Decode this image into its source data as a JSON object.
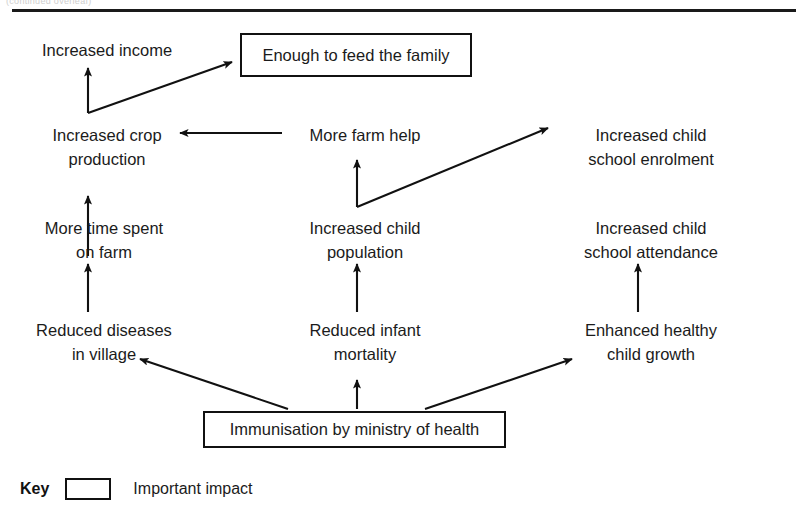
{
  "page": {
    "top_caption": "(continued overleaf)",
    "background": "#ffffff",
    "ink": "#1b1b1b"
  },
  "diagram": {
    "type": "flow-diagram",
    "nodes": [
      {
        "id": "increased-income",
        "label": "Increased income",
        "style": "plain",
        "x": 22,
        "y": 38,
        "w": 170
      },
      {
        "id": "enough-to-feed-family",
        "label": "Enough to feed the family",
        "style": "boxed",
        "x": 240,
        "y": 33,
        "w": 232,
        "h": 44
      },
      {
        "id": "increased-crop-production",
        "label": "Increased crop\nproduction",
        "style": "plain",
        "x": 22,
        "y": 123,
        "w": 170
      },
      {
        "id": "more-farm-help",
        "label": "More farm help",
        "style": "plain",
        "x": 285,
        "y": 123,
        "w": 160
      },
      {
        "id": "increased-child-school-enrolment",
        "label": "Increased child\nschool enrolment",
        "style": "plain",
        "x": 556,
        "y": 123,
        "w": 190
      },
      {
        "id": "more-time-spent-on-farm",
        "label": "More time spent\non farm",
        "style": "plain",
        "x": 16,
        "y": 216,
        "w": 176
      },
      {
        "id": "increased-child-population",
        "label": "Increased child\npopulation",
        "style": "plain",
        "x": 285,
        "y": 216,
        "w": 160
      },
      {
        "id": "increased-child-school-attendance",
        "label": "Increased child\nschool attendance",
        "style": "plain",
        "x": 556,
        "y": 216,
        "w": 190
      },
      {
        "id": "reduced-diseases-in-village",
        "label": "Reduced diseases\nin village",
        "style": "plain",
        "x": 12,
        "y": 318,
        "w": 184
      },
      {
        "id": "reduced-infant-mortality",
        "label": "Reduced infant\nmortality",
        "style": "plain",
        "x": 285,
        "y": 318,
        "w": 160
      },
      {
        "id": "enhanced-healthy-child-growth",
        "label": "Enhanced healthy\nchild growth",
        "style": "plain",
        "x": 556,
        "y": 318,
        "w": 190
      },
      {
        "id": "immunisation-by-ministry-of-health",
        "label": "Immunisation by ministry of health",
        "style": "boxed",
        "x": 203,
        "y": 411,
        "w": 303,
        "h": 37
      }
    ],
    "edges": [
      {
        "from": "increased-crop-production",
        "to": "increased-income",
        "kind": "vertical"
      },
      {
        "from": "increased-crop-production",
        "to": "enough-to-feed-family",
        "kind": "diagonal"
      },
      {
        "from": "more-farm-help",
        "to": "increased-crop-production",
        "kind": "horizontal"
      },
      {
        "from": "more-time-spent-on-farm",
        "to": "increased-crop-production",
        "kind": "vertical"
      },
      {
        "from": "increased-child-population",
        "to": "more-farm-help",
        "kind": "vertical"
      },
      {
        "from": "increased-child-population",
        "to": "increased-child-school-enrolment",
        "kind": "diagonal"
      },
      {
        "from": "reduced-diseases-in-village",
        "to": "more-time-spent-on-farm",
        "kind": "vertical"
      },
      {
        "from": "reduced-infant-mortality",
        "to": "increased-child-population",
        "kind": "vertical"
      },
      {
        "from": "enhanced-healthy-child-growth",
        "to": "increased-child-school-attendance",
        "kind": "vertical"
      },
      {
        "from": "immunisation-by-ministry-of-health",
        "to": "reduced-diseases-in-village",
        "kind": "diagonal"
      },
      {
        "from": "immunisation-by-ministry-of-health",
        "to": "reduced-infant-mortality",
        "kind": "vertical"
      },
      {
        "from": "immunisation-by-ministry-of-health",
        "to": "enhanced-healthy-child-growth",
        "kind": "diagonal"
      }
    ]
  },
  "key": {
    "title": "Key",
    "entries": [
      {
        "swatch": "box-outline",
        "label": "Important impact"
      }
    ]
  }
}
